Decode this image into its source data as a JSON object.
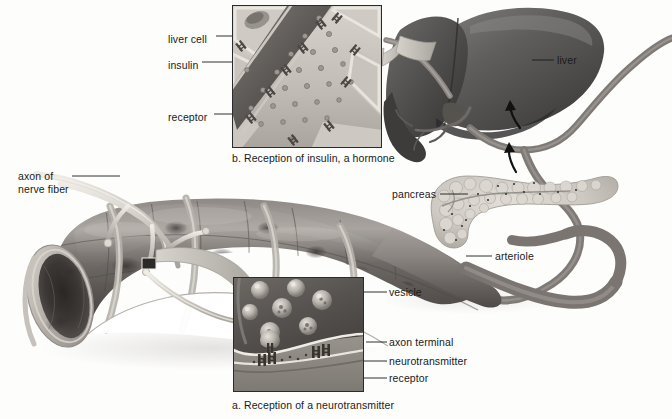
{
  "figure": {
    "background_color": "#fdfdfc",
    "ink_color": "#1a1a1a"
  },
  "panels": [
    {
      "id": "panel-b",
      "caption": "b. Reception of insulin, a hormone",
      "x": 232,
      "y": 5,
      "width": 150,
      "height": 143,
      "caption_x": 232,
      "caption_y": 153,
      "labels": [
        {
          "name": "liver-cell",
          "text": "liver cell",
          "x": 168,
          "y": 35,
          "leader_to_x": 252,
          "leader_to_y": 40
        },
        {
          "name": "insulin",
          "text": "insulin",
          "x": 168,
          "y": 61,
          "leader_to_x": 290,
          "leader_to_y": 66
        },
        {
          "name": "receptor",
          "text": "receptor",
          "x": 168,
          "y": 113,
          "leader_to_x": 247,
          "leader_to_y": 118
        }
      ]
    },
    {
      "id": "panel-a",
      "caption": "a. Reception of a neurotransmitter",
      "x": 233,
      "y": 277,
      "width": 131,
      "height": 115,
      "caption_x": 232,
      "caption_y": 400,
      "labels": [
        {
          "name": "vesicle",
          "text": "vesicle",
          "x": 389,
          "y": 288,
          "leader_to_x": 347,
          "leader_to_y": 293
        },
        {
          "name": "axon-terminal",
          "text": "axon terminal",
          "x": 389,
          "y": 338,
          "leader_to_x": 363,
          "leader_to_y": 343
        },
        {
          "name": "neurotransmitter",
          "text": "neurotransmitter",
          "x": 389,
          "y": 357,
          "leader_to_x": 318,
          "leader_to_y": 362
        },
        {
          "name": "receptor",
          "text": "receptor",
          "x": 389,
          "y": 375,
          "leader_to_x": 312,
          "leader_to_y": 370
        }
      ]
    }
  ],
  "labels": [
    {
      "name": "axon-of-nerve-fiber",
      "line1": "axon of",
      "line2": "nerve fiber",
      "x": 18,
      "y": 172
    },
    {
      "name": "liver",
      "text": "liver",
      "x": 556,
      "y": 56
    },
    {
      "name": "pancreas",
      "text": "pancreas",
      "x": 392,
      "y": 190
    },
    {
      "name": "arteriole",
      "text": "arteriole",
      "x": 494,
      "y": 251
    }
  ],
  "anatomy": {
    "liver_name": "liver",
    "pancreas_name": "pancreas",
    "arteriole_name": "arteriole",
    "vein_name": "hepatic vessel",
    "blood_vessel_name": "blood vessel cutaway",
    "nerve_name": "axon of nerve fiber",
    "flow_arrow_1": "blood flow toward liver",
    "flow_arrow_2": "blood flow from pancreas"
  },
  "colors": {
    "ink": "#1a1a1a",
    "vessel_dark": "#6e6a68",
    "vessel_mid": "#8e8a87",
    "vessel_light": "#b9b5b1",
    "liver_dark": "#5d5b5a",
    "liver_mid": "#7a7876",
    "pancreas": "#cfccc6",
    "panel_border": "#2b2b2b",
    "callout": "#c3c0bb"
  }
}
